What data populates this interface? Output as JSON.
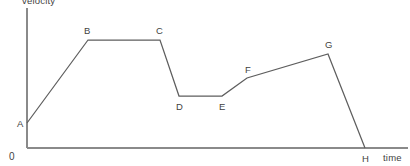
{
  "chart_data": {
    "type": "line",
    "title": "",
    "xlabel": "time",
    "ylabel": "velocity",
    "origin_label": "0",
    "grid": false,
    "legend": false,
    "xlim": [
      0,
      1
    ],
    "ylim": [
      0,
      1
    ],
    "axis_ticks": [],
    "points": [
      {
        "label": "A",
        "x": 0.0,
        "y": 0.205,
        "px": 27,
        "py": 123
      },
      {
        "label": "B",
        "x": 0.16,
        "y": 0.885,
        "px": 88,
        "py": 40
      },
      {
        "label": "C",
        "x": 0.35,
        "y": 0.885,
        "px": 160,
        "py": 40
      },
      {
        "label": "D",
        "x": 0.4,
        "y": 0.427,
        "px": 179,
        "py": 96
      },
      {
        "label": "E",
        "x": 0.51,
        "y": 0.427,
        "px": 222,
        "py": 96
      },
      {
        "label": "F",
        "x": 0.58,
        "y": 0.574,
        "px": 247,
        "py": 78
      },
      {
        "label": "G",
        "x": 0.79,
        "y": 0.77,
        "px": 328,
        "py": 54
      },
      {
        "label": "H",
        "x": 0.89,
        "y": 0.0,
        "px": 365,
        "py": 148
      }
    ],
    "segments": [
      {
        "from": "A",
        "to": "B",
        "description": "uniform acceleration"
      },
      {
        "from": "B",
        "to": "C",
        "description": "constant velocity"
      },
      {
        "from": "C",
        "to": "D",
        "description": "deceleration"
      },
      {
        "from": "D",
        "to": "E",
        "description": "constant velocity"
      },
      {
        "from": "E",
        "to": "F",
        "description": "acceleration"
      },
      {
        "from": "F",
        "to": "G",
        "description": "gradual acceleration"
      },
      {
        "from": "G",
        "to": "H",
        "description": "deceleration to rest"
      }
    ],
    "label_offsets": {
      "A": {
        "dx": -10,
        "dy": 4
      },
      "B": {
        "dx": -4,
        "dy": -6
      },
      "C": {
        "dx": -4,
        "dy": -6
      },
      "D": {
        "dx": -3,
        "dy": 14
      },
      "E": {
        "dx": -3,
        "dy": 14
      },
      "F": {
        "dx": -2,
        "dy": -5
      },
      "G": {
        "dx": -3,
        "dy": -6
      },
      "H": {
        "dx": -3,
        "dy": 14
      }
    },
    "axes": {
      "y_axis": {
        "x": 27,
        "y_top": 8,
        "y_bottom": 148
      },
      "x_axis": {
        "y": 148,
        "x_left": 27,
        "x_right": 408
      }
    },
    "ylabel_pos": {
      "x": 22,
      "y": 4
    },
    "xlabel_pos": {
      "x": 383,
      "y": 161
    },
    "origin_pos": {
      "x": 9,
      "y": 160
    }
  },
  "colors": {
    "background": "#ffffff",
    "axis": "#8a8a8a",
    "series": "#5e5e5e",
    "text": "#3f3f3f"
  }
}
